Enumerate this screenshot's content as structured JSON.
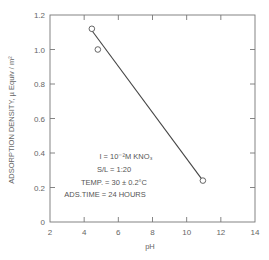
{
  "chart_data": {
    "type": "scatter",
    "title": "",
    "xlabel": "pH",
    "ylabel": "ADSORPTION DENSITY, µ Equiv / m²",
    "xlim": [
      2,
      14
    ],
    "ylim": [
      0,
      1.2
    ],
    "x_ticks": [
      2,
      4,
      6,
      8,
      10,
      12,
      14
    ],
    "y_ticks": [
      0,
      0.2,
      0.4,
      0.6,
      0.8,
      1.0,
      1.2
    ],
    "x_tick_labels": [
      "2",
      "4",
      "6",
      "8",
      "10",
      "12",
      "14"
    ],
    "y_tick_labels": [
      "0",
      "0.2",
      "0.4",
      "0.6",
      "0.8",
      "1.0",
      "1.2"
    ],
    "grid": false,
    "series": [
      {
        "name": "data",
        "marker": "open-circle",
        "points": [
          {
            "x": 4.45,
            "y": 1.12
          },
          {
            "x": 4.8,
            "y": 1.0
          },
          {
            "x": 10.95,
            "y": 0.24
          }
        ]
      },
      {
        "name": "fit-line",
        "type": "line",
        "points": [
          {
            "x": 4.45,
            "y": 1.11
          },
          {
            "x": 10.95,
            "y": 0.24
          }
        ]
      }
    ],
    "annotations": [
      "I = 10⁻²M KNO₃",
      "S/L = 1:20",
      "TEMP. = 30 ± 0.2°C",
      "ADS.TIME = 24 HOURS"
    ]
  },
  "labels": {
    "xlabel": "pH",
    "ylabel_main": "ADSORPTION DENSITY, ",
    "ylabel_unit": "µ Equiv / m²",
    "annot_1": "I = 10⁻²M KNO₃",
    "annot_2": "S/L = 1:20",
    "annot_3": "TEMP. = 30 ± 0.2°C",
    "annot_4": "ADS.TIME = 24 HOURS"
  }
}
